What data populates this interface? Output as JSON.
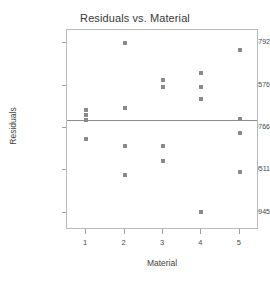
{
  "chart_data": {
    "type": "scatter",
    "title": "Residuals vs. Material",
    "xlabel": "Material",
    "ylabel": "Residuals",
    "x_categories": [
      1,
      2,
      3,
      4,
      5
    ],
    "xtick_labels": [
      "1",
      "2",
      "3",
      "4",
      "5"
    ],
    "ytick_labels": [
      "1.64792",
      "0.733576",
      "-0.180766",
      "-1.09511",
      "-2.00945"
    ],
    "ytick_values": [
      1.64792,
      0.733576,
      -0.180766,
      -1.09511,
      -2.00945
    ],
    "xlim": [
      0.5,
      5.5
    ],
    "ylim": [
      -2.38,
      1.93
    ],
    "grid": false,
    "legend": false,
    "reference_line": {
      "orientation": "horizontal",
      "value": 0.0,
      "color": "#8c8c8c"
    },
    "marker": {
      "shape": "square",
      "color": "#8a8a8a",
      "size_px": 4
    },
    "points": [
      {
        "x": 1,
        "y": 0.2
      },
      {
        "x": 1,
        "y": 0.1
      },
      {
        "x": 1,
        "y": 0.0
      },
      {
        "x": 1,
        "y": -0.41
      },
      {
        "x": 2,
        "y": 1.65
      },
      {
        "x": 2,
        "y": 0.25
      },
      {
        "x": 2,
        "y": -0.56
      },
      {
        "x": 2,
        "y": -1.19
      },
      {
        "x": 3,
        "y": 0.85
      },
      {
        "x": 3,
        "y": 0.71
      },
      {
        "x": 3,
        "y": -0.58
      },
      {
        "x": 3,
        "y": -0.9
      },
      {
        "x": 4,
        "y": 1.0
      },
      {
        "x": 4,
        "y": 0.71
      },
      {
        "x": 4,
        "y": 0.45
      },
      {
        "x": 4,
        "y": -2.0
      },
      {
        "x": 5,
        "y": 1.5
      },
      {
        "x": 5,
        "y": 0.02
      },
      {
        "x": 5,
        "y": -0.28
      },
      {
        "x": 5,
        "y": -1.13
      }
    ]
  }
}
